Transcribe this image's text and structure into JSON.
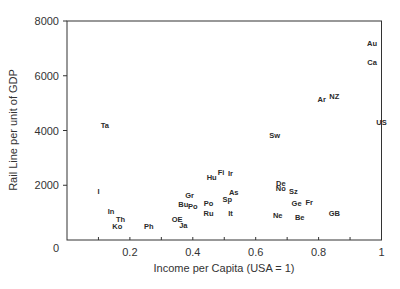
{
  "chart_data": {
    "type": "scatter",
    "title": "",
    "xlabel": "Income per Capita (USA = 1)",
    "ylabel": "Rail Line per unit of GDP",
    "xlim": [
      0,
      1
    ],
    "ylim": [
      0,
      8000
    ],
    "xticks": [
      0.2,
      0.4,
      0.6,
      0.8,
      1
    ],
    "xtick_labels": [
      "0.2",
      "0.4",
      "0.6",
      "0.8",
      "1"
    ],
    "xminor_ticks": [
      0.1,
      0.3,
      0.5,
      0.7,
      0.9
    ],
    "yticks": [
      0,
      2000,
      4000,
      6000,
      8000
    ],
    "ytick_labels": [
      "0",
      "2000",
      "4000",
      "6000",
      "8000"
    ],
    "grid": false,
    "legend": null,
    "marker": "text-label",
    "points": [
      {
        "label": "Au",
        "x": 0.97,
        "y": 7200
      },
      {
        "label": "Ca",
        "x": 0.97,
        "y": 6500
      },
      {
        "label": "Ar",
        "x": 0.81,
        "y": 5150
      },
      {
        "label": "NZ",
        "x": 0.85,
        "y": 5250
      },
      {
        "label": "US",
        "x": 1.0,
        "y": 4300
      },
      {
        "label": "Sw",
        "x": 0.66,
        "y": 3850
      },
      {
        "label": "Ta",
        "x": 0.12,
        "y": 4200
      },
      {
        "label": "I",
        "x": 0.1,
        "y": 1800
      },
      {
        "label": "In",
        "x": 0.14,
        "y": 1050
      },
      {
        "label": "Th",
        "x": 0.17,
        "y": 750
      },
      {
        "label": "Ko",
        "x": 0.16,
        "y": 500
      },
      {
        "label": "Ph",
        "x": 0.26,
        "y": 500
      },
      {
        "label": "OE",
        "x": 0.35,
        "y": 750
      },
      {
        "label": "Ja",
        "x": 0.37,
        "y": 550
      },
      {
        "label": "Bu",
        "x": 0.37,
        "y": 1300
      },
      {
        "label": "Po",
        "x": 0.4,
        "y": 1250
      },
      {
        "label": "Gr",
        "x": 0.39,
        "y": 1650
      },
      {
        "label": "Hu",
        "x": 0.46,
        "y": 2300
      },
      {
        "label": "Fi",
        "x": 0.49,
        "y": 2500
      },
      {
        "label": "Ir",
        "x": 0.52,
        "y": 2450
      },
      {
        "label": "Po",
        "x": 0.45,
        "y": 1350
      },
      {
        "label": "Ru",
        "x": 0.45,
        "y": 1000
      },
      {
        "label": "As",
        "x": 0.53,
        "y": 1750
      },
      {
        "label": "Sp",
        "x": 0.51,
        "y": 1500
      },
      {
        "label": "It",
        "x": 0.52,
        "y": 1000
      },
      {
        "label": "De",
        "x": 0.68,
        "y": 2100
      },
      {
        "label": "No",
        "x": 0.68,
        "y": 1900
      },
      {
        "label": "Sz",
        "x": 0.72,
        "y": 1800
      },
      {
        "label": "Ge",
        "x": 0.73,
        "y": 1350
      },
      {
        "label": "Fr",
        "x": 0.77,
        "y": 1400
      },
      {
        "label": "Ne",
        "x": 0.67,
        "y": 900
      },
      {
        "label": "Be",
        "x": 0.74,
        "y": 850
      },
      {
        "label": "GB",
        "x": 0.85,
        "y": 1000
      }
    ]
  }
}
